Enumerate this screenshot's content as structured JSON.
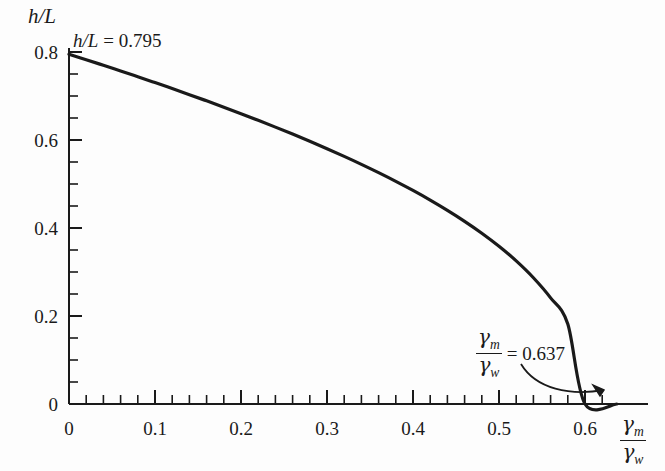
{
  "figure": {
    "background_color": "#fdfdfd",
    "curve_color": "#1a1a1a",
    "axis_color": "#1a1a1a"
  },
  "axes": {
    "y_title": "h/L",
    "x_title_num": "γ",
    "x_title_num_sub": "m",
    "x_title_den": "γ",
    "x_title_den_sub": "w",
    "x_ticks": [
      "0",
      "0.1",
      "0.2",
      "0.3",
      "0.4",
      "0.5",
      "0.6"
    ],
    "y_ticks": [
      "0",
      "0.2",
      "0.4",
      "0.6",
      "0.8"
    ]
  },
  "annotations": {
    "peak": {
      "var": "h/L",
      "eq": "= 0.795"
    },
    "endpoint": {
      "num": "γ",
      "num_sub": "m",
      "den": "γ",
      "den_sub": "w",
      "eq": "= 0.637"
    }
  },
  "chart_data": {
    "type": "line",
    "title": "",
    "xlabel": "gamma_m / gamma_w",
    "ylabel": "h/L",
    "xlim": [
      0,
      0.66
    ],
    "ylim": [
      0,
      0.85
    ],
    "grid": false,
    "legend": "none",
    "x_tick_values": [
      0,
      0.1,
      0.2,
      0.3,
      0.4,
      0.5,
      0.6
    ],
    "y_tick_values": [
      0,
      0.2,
      0.4,
      0.6,
      0.8
    ],
    "x_minor_tick_step": 0.02,
    "y_minor_tick_step": 0.05,
    "annotations": [
      {
        "text": "h/L = 0.795",
        "x": 0.0,
        "y": 0.795
      },
      {
        "text": "gamma_m/gamma_w = 0.637",
        "x": 0.637,
        "y": 0.0
      }
    ],
    "series": [
      {
        "name": "h/L vs gamma_m/gamma_w",
        "x": [
          0.0,
          0.02,
          0.04,
          0.06,
          0.08,
          0.1,
          0.12,
          0.14,
          0.16,
          0.18,
          0.2,
          0.22,
          0.24,
          0.26,
          0.28,
          0.3,
          0.32,
          0.34,
          0.36,
          0.38,
          0.4,
          0.42,
          0.44,
          0.46,
          0.48,
          0.5,
          0.52,
          0.54,
          0.56,
          0.58,
          0.6,
          0.61,
          0.62,
          0.625,
          0.63,
          0.634,
          0.636,
          0.637
        ],
        "y": [
          0.795,
          0.7825,
          0.7698,
          0.7569,
          0.7438,
          0.7305,
          0.7169,
          0.7031,
          0.689,
          0.6746,
          0.6599,
          0.6448,
          0.6293,
          0.6134,
          0.5971,
          0.5802,
          0.5627,
          0.5446,
          0.5257,
          0.506,
          0.4853,
          0.4634,
          0.4401,
          0.4152,
          0.3882,
          0.3585,
          0.3253,
          0.287,
          0.2412,
          0.1817,
          0.0,
          0.0,
          0.0,
          0.0,
          0.0,
          0.0,
          0.0,
          0.0
        ]
      }
    ]
  }
}
